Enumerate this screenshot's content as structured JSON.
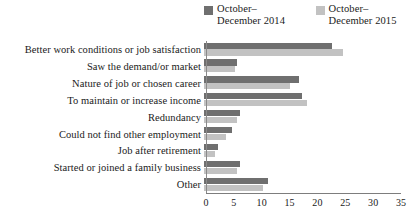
{
  "chart_data": {
    "type": "bar",
    "orientation": "horizontal",
    "title": "",
    "xlabel": "",
    "ylabel": "",
    "xlim": [
      0,
      35
    ],
    "xticks": [
      0,
      5,
      10,
      15,
      20,
      25,
      30,
      35
    ],
    "grid": false,
    "legend_position": "top-right",
    "categories": [
      "Better work conditions or job satisfaction",
      "Saw the demand/or market",
      "Nature of job or chosen career",
      "To maintain or increase income",
      "Redundancy",
      "Could not find other employment",
      "Job after retirement",
      "Started or joined a family business",
      "Other"
    ],
    "series": [
      {
        "name": "October–December 2014",
        "color": "#6f6f6f",
        "values": [
          23,
          6,
          17,
          17.5,
          6.5,
          5,
          2.5,
          6.5,
          11.5
        ]
      },
      {
        "name": "October–December 2015",
        "color": "#c2c2c2",
        "values": [
          25,
          5.5,
          15.5,
          18.5,
          6,
          4,
          2,
          6,
          10.5
        ]
      }
    ]
  },
  "legend": {
    "items": [
      {
        "label": "October–\nDecember 2014",
        "color": "#6f6f6f"
      },
      {
        "label": "October–\nDecember 2015",
        "color": "#c2c2c2"
      }
    ]
  }
}
